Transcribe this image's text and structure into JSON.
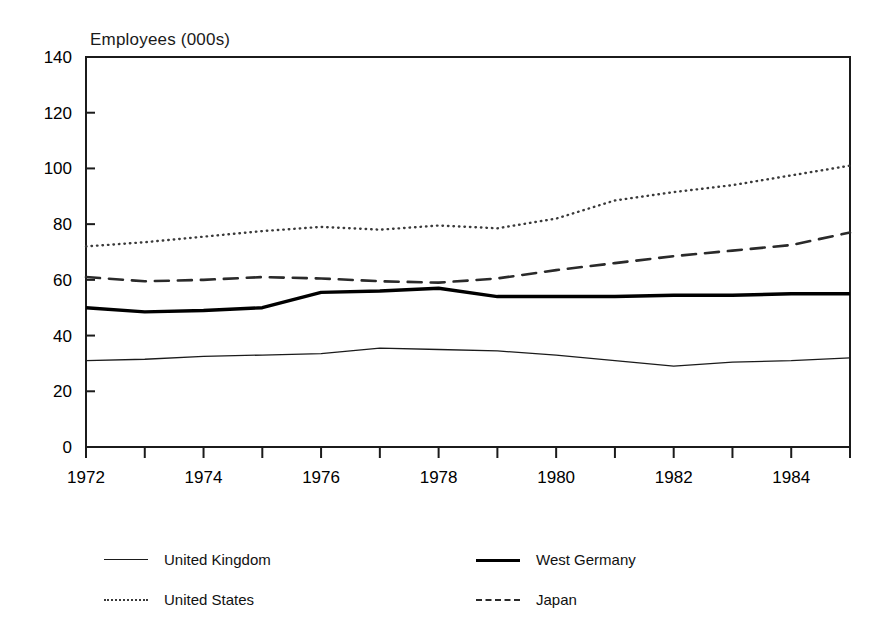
{
  "chart_data": {
    "type": "line",
    "title": "Employees (000s)",
    "xlabel": "",
    "ylabel": "Employees (000s)",
    "xlim": [
      1972,
      1985
    ],
    "ylim": [
      0,
      140
    ],
    "grid": false,
    "legend_position": "bottom",
    "x": [
      1972,
      1973,
      1974,
      1975,
      1976,
      1977,
      1978,
      1979,
      1980,
      1981,
      1982,
      1983,
      1984,
      1985
    ],
    "y_ticks": [
      0,
      20,
      40,
      60,
      80,
      100,
      120,
      140
    ],
    "y_tick_labels": [
      "0",
      "20",
      "40",
      "60",
      "80",
      "100",
      "120",
      "140"
    ],
    "x_ticks": [
      1972,
      1973,
      1974,
      1975,
      1976,
      1977,
      1978,
      1979,
      1980,
      1981,
      1982,
      1983,
      1984,
      1985
    ],
    "x_tick_labels": [
      "1972",
      "",
      "1974",
      "",
      "1976",
      "",
      "1978",
      "",
      "1980",
      "",
      "1982",
      "",
      "1984",
      ""
    ],
    "x_major_labels": [
      "1972",
      "1974",
      "1976",
      "1978",
      "1980",
      "1982",
      "1984"
    ],
    "series": [
      {
        "name": "United Kingdom",
        "style": "solid-thin",
        "color": "#1b1b1b",
        "values": [
          31,
          31.5,
          32.5,
          33,
          33.5,
          35.5,
          35,
          34.5,
          33,
          31,
          29,
          30.5,
          31,
          32
        ]
      },
      {
        "name": "United States",
        "style": "dotted",
        "color": "#3a3a3a",
        "values": [
          72,
          73.5,
          75.5,
          77.5,
          79,
          78,
          79.5,
          78.5,
          82,
          88.5,
          91.5,
          94,
          97.5,
          101
        ]
      },
      {
        "name": "West Germany",
        "style": "solid-thick",
        "color": "#000000",
        "values": [
          50,
          48.5,
          49,
          50,
          55.5,
          56,
          57,
          54,
          54,
          54,
          54.5,
          54.5,
          55,
          55
        ]
      },
      {
        "name": "Japan",
        "style": "dashed",
        "color": "#2a2a2a",
        "values": [
          61,
          59.5,
          60,
          61,
          60.5,
          59.5,
          59,
          60.5,
          63.5,
          66,
          68.5,
          70.5,
          72.5,
          77
        ]
      }
    ]
  },
  "legend": {
    "entries": [
      {
        "label": "United Kingdom",
        "style": "sw-uk"
      },
      {
        "label": "West Germany",
        "style": "sw-wg"
      },
      {
        "label": "United States",
        "style": "sw-us"
      },
      {
        "label": "Japan",
        "style": "sw-jp"
      }
    ]
  }
}
